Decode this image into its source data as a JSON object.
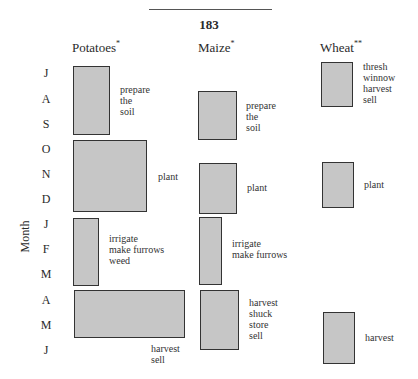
{
  "page": {
    "number": "183"
  },
  "axis": {
    "label": "Month"
  },
  "months": [
    "J",
    "A",
    "S",
    "O",
    "N",
    "D",
    "J",
    "F",
    "M",
    "A",
    "M",
    "J"
  ],
  "columns": [
    {
      "name": "Potatoes",
      "mark": "*"
    },
    {
      "name": "Maize",
      "mark": "*"
    },
    {
      "name": "Wheat",
      "mark": "**"
    }
  ],
  "activities": {
    "potatoes": [
      {
        "task": "prepare\nthe\nsoil"
      },
      {
        "task": "plant"
      },
      {
        "task": "irrigate\nmake furrows\nweed"
      },
      {
        "task": "harvest\nsell"
      }
    ],
    "maize": [
      {
        "task": "prepare\nthe\nsoil"
      },
      {
        "task": "plant"
      },
      {
        "task": "irrigate\nmake furrows"
      },
      {
        "task": "harvest\nshuck\nstore\nsell"
      }
    ],
    "wheat": [
      {
        "task": "thresh\nwinnow\nharvest\nsell"
      },
      {
        "task": "plant"
      },
      {
        "task": "harvest"
      }
    ]
  },
  "colors": {
    "box_fill": "#c6c6c6",
    "box_border": "#333333"
  }
}
